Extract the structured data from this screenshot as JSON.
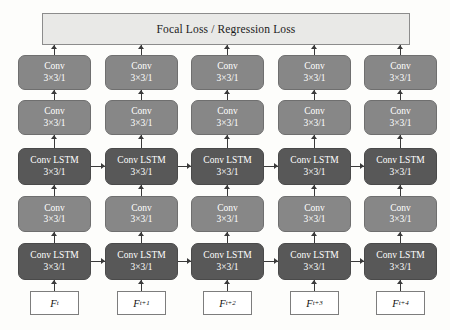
{
  "diagram": {
    "loss": {
      "label": "Focal Loss / Regression Loss"
    },
    "colors": {
      "conv_fill": "#878787",
      "lstm_fill": "#585858",
      "loss_fill": "#e9e9e7",
      "input_fill": "#ffffff",
      "arrow": "#3a3a3a"
    },
    "block_labels": {
      "conv_name": "Conv",
      "lstm_name": "Conv LSTM",
      "kernel": "3×3/1"
    },
    "rows": [
      {
        "id": "row-conv-top",
        "type": "conv",
        "name": "Conv",
        "kernel": "3×3/1"
      },
      {
        "id": "row-conv-upper",
        "type": "conv",
        "name": "Conv",
        "kernel": "3×3/1"
      },
      {
        "id": "row-lstm-upper",
        "type": "lstm",
        "name": "Conv LSTM",
        "kernel": "3×3/1"
      },
      {
        "id": "row-conv-lower",
        "type": "conv",
        "name": "Conv",
        "kernel": "3×3/1"
      },
      {
        "id": "row-lstm-lower",
        "type": "lstm",
        "name": "Conv LSTM",
        "kernel": "3×3/1"
      }
    ],
    "columns": [
      {
        "id": "t0",
        "input_base": "F",
        "input_sub": "t"
      },
      {
        "id": "t1",
        "input_base": "F",
        "input_sub": "t+1"
      },
      {
        "id": "t2",
        "input_base": "F",
        "input_sub": "t+2"
      },
      {
        "id": "t3",
        "input_base": "F",
        "input_sub": "t+3"
      },
      {
        "id": "t4",
        "input_base": "F",
        "input_sub": "t+4"
      }
    ]
  }
}
